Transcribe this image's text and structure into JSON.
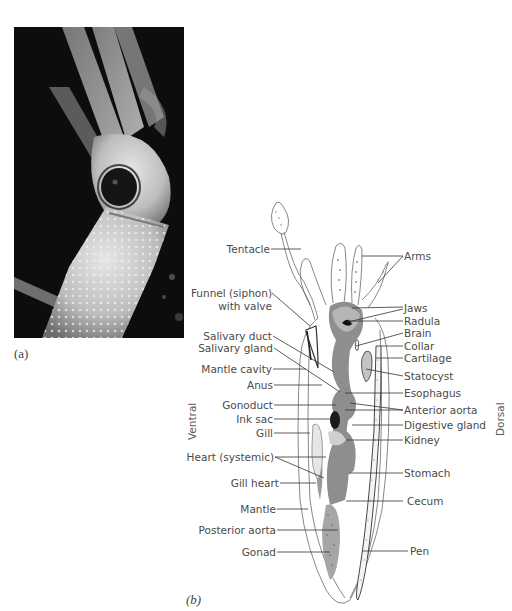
{
  "figure": {
    "panel_a": {
      "label": "(a)",
      "content": "photo-of-squid"
    },
    "panel_b": {
      "label": "(b)",
      "orientation": {
        "left": "Ventral",
        "right": "Dorsal"
      },
      "labels_left": [
        "Tentacle",
        "Funnel (siphon)",
        "with valve",
        "Salivary duct",
        "Salivary gland",
        "Mantle cavity",
        "Anus",
        "Gonoduct",
        "Ink sac",
        "Gill",
        "Heart (systemic)",
        "Gill heart",
        "Mantle",
        "Posterior aorta",
        "Gonad"
      ],
      "labels_right": [
        "Arms",
        "Jaws",
        "Radula",
        "Brain",
        "Collar",
        "Cartilage",
        "Statocyst",
        "Esophagus",
        "Anterior aorta",
        "Digestive gland",
        "Kidney",
        "Stomach",
        "Cecum",
        "Pen"
      ]
    },
    "colors": {
      "organ_gray": "#8a8a8a",
      "outline": "#555555",
      "leader": "#333333"
    }
  }
}
